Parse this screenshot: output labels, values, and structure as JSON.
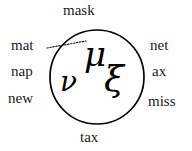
{
  "figure": {
    "background_color": "#ffffff",
    "stroke_color": "#000000",
    "text_color": "#1a1a1a",
    "circle": {
      "center_x": 97,
      "center_y": 77,
      "radius": 47,
      "stroke_width": 1.7
    },
    "connector": {
      "style": "dotted",
      "from_label": "mat",
      "to_symbol": "mu",
      "x1": 47,
      "y1": 48,
      "x2": 86,
      "y2": 41
    }
  },
  "inside_symbols": [
    {
      "id": "mu",
      "glyph": "μ",
      "name": "mu"
    },
    {
      "id": "nu",
      "glyph": "ν",
      "name": "nu"
    },
    {
      "id": "xi",
      "glyph": "ξ",
      "name": "xi"
    }
  ],
  "outside_labels": {
    "top": "mask",
    "bottom": "tax",
    "left": [
      "mat",
      "nap",
      "new"
    ],
    "right": [
      "net",
      "ax",
      "miss"
    ]
  }
}
